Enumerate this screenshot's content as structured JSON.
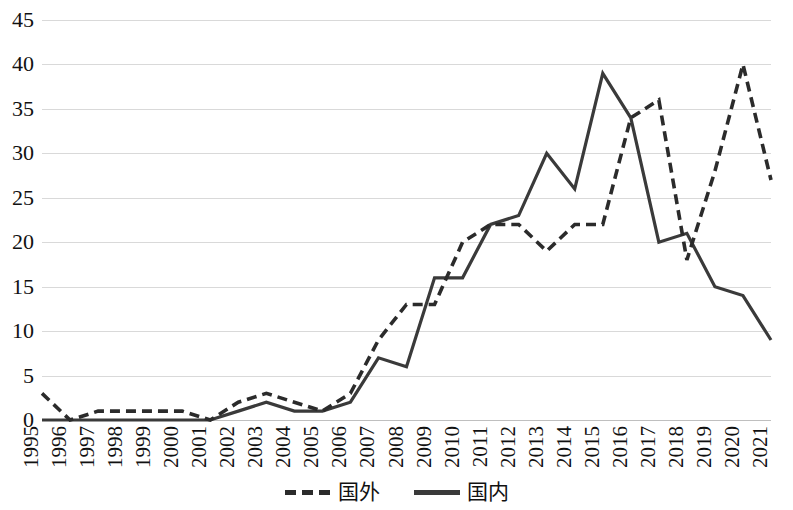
{
  "chart_data": {
    "type": "line",
    "title": "",
    "subtitle": "",
    "xlabel": "",
    "ylabel": "",
    "ylim": [
      0,
      45
    ],
    "ytick_step": 5,
    "yticks": [
      0,
      5,
      10,
      15,
      20,
      25,
      30,
      35,
      40,
      45
    ],
    "grid": true,
    "legend_position": "bottom-center",
    "categories": [
      "1995",
      "1996",
      "1997",
      "1998",
      "1999",
      "2000",
      "2001",
      "2002",
      "2003",
      "2004",
      "2005",
      "2006",
      "2007",
      "2008",
      "2009",
      "2010",
      "2011",
      "2012",
      "2013",
      "2014",
      "2015",
      "2016",
      "2017",
      "2018",
      "2019",
      "2020",
      "2021"
    ],
    "series": [
      {
        "name": "国外",
        "style": "dashed",
        "color": "#2b2b2b",
        "values": [
          3,
          0,
          1,
          1,
          1,
          1,
          0,
          2,
          3,
          2,
          1,
          3,
          9,
          13,
          13,
          20,
          22,
          22,
          19,
          22,
          22,
          34,
          36,
          18,
          28,
          40,
          27
        ]
      },
      {
        "name": "国内",
        "style": "solid",
        "color": "#3a3a3a",
        "values": [
          0,
          0,
          0,
          0,
          0,
          0,
          0,
          1,
          2,
          1,
          1,
          2,
          7,
          6,
          16,
          16,
          22,
          23,
          30,
          26,
          39,
          34,
          20,
          21,
          15,
          14,
          9
        ]
      }
    ]
  },
  "legend": {
    "items": [
      {
        "label": "国外",
        "style": "dashed"
      },
      {
        "label": "国内",
        "style": "solid"
      }
    ]
  }
}
